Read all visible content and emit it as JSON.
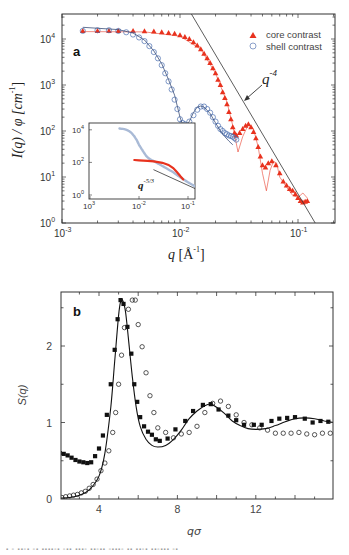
{
  "chart_data": [
    {
      "panel": "a",
      "type": "scatter",
      "scale": {
        "x": "log",
        "y": "log"
      },
      "xlim": [
        0.001,
        0.2
      ],
      "ylim": [
        1,
        35000
      ],
      "xlabel": "q [Å⁻¹]",
      "ylabel": "I(q) / φ [cm⁻¹]",
      "xticks": [
        "10⁻³",
        "10⁻²",
        "10⁻¹"
      ],
      "yticks": [
        "10⁰",
        "10¹",
        "10²",
        "10³",
        "10⁴"
      ],
      "legend": {
        "position": "upper right",
        "entries": [
          "core contrast",
          "shell contrast"
        ]
      },
      "annotations": [
        "a",
        "q⁻⁴"
      ],
      "series": [
        {
          "name": "core contrast",
          "marker": "filled-triangle",
          "color": "#e8321e",
          "x": [
            0.0015,
            0.002,
            0.0025,
            0.003,
            0.004,
            0.005,
            0.006,
            0.007,
            0.008,
            0.009,
            0.01,
            0.011,
            0.012,
            0.013,
            0.014,
            0.015,
            0.016,
            0.017,
            0.018,
            0.019,
            0.02,
            0.021,
            0.022,
            0.023,
            0.024,
            0.025,
            0.026,
            0.027,
            0.028,
            0.029,
            0.03,
            0.032,
            0.034,
            0.036,
            0.038,
            0.04,
            0.042,
            0.044,
            0.046,
            0.048,
            0.05,
            0.053,
            0.056,
            0.06,
            0.065,
            0.07,
            0.075,
            0.08,
            0.085,
            0.09,
            0.095,
            0.1,
            0.105,
            0.11,
            0.115,
            0.12
          ],
          "y": [
            15000,
            15000,
            15000,
            15000,
            15000,
            14800,
            14500,
            14000,
            13500,
            13000,
            12000,
            11000,
            10000,
            8500,
            7200,
            6000,
            4800,
            3800,
            3000,
            2300,
            1800,
            1300,
            1000,
            700,
            520,
            380,
            260,
            180,
            120,
            90,
            80,
            90,
            110,
            130,
            140,
            120,
            95,
            70,
            45,
            28,
            18,
            16,
            20,
            22,
            18,
            12,
            8,
            6.5,
            5.5,
            5,
            4.2,
            3.5,
            3,
            2.8,
            2.9,
            3
          ]
        },
        {
          "name": "core contrast fit",
          "type": "line",
          "color": "#e8321e",
          "x": [
            0.0015,
            0.005,
            0.01,
            0.015,
            0.02,
            0.025,
            0.028,
            0.031,
            0.034,
            0.038,
            0.042,
            0.046,
            0.05,
            0.054,
            0.058,
            0.062,
            0.066,
            0.07,
            0.08,
            0.09,
            0.1,
            0.11,
            0.12
          ],
          "y": [
            14500,
            14300,
            11500,
            6000,
            1800,
            420,
            130,
            35,
            75,
            140,
            110,
            45,
            12,
            5,
            14,
            22,
            20,
            10,
            6,
            4,
            3.6,
            4.5,
            3.5
          ]
        },
        {
          "name": "shell contrast",
          "marker": "open-circle",
          "color": "#4a6fb0",
          "x": [
            0.0015,
            0.002,
            0.0025,
            0.003,
            0.0035,
            0.004,
            0.0045,
            0.005,
            0.0055,
            0.006,
            0.0065,
            0.007,
            0.0075,
            0.008,
            0.0085,
            0.009,
            0.0095,
            0.01,
            0.0105,
            0.011,
            0.012,
            0.013,
            0.014,
            0.015,
            0.016,
            0.017,
            0.018,
            0.019,
            0.02,
            0.021,
            0.022,
            0.023,
            0.024,
            0.025,
            0.026,
            0.027,
            0.028,
            0.029,
            0.03
          ],
          "y": [
            15000,
            15500,
            15500,
            15000,
            14000,
            12500,
            10800,
            9000,
            7000,
            5200,
            3800,
            2700,
            1800,
            1200,
            800,
            480,
            300,
            180,
            150,
            140,
            160,
            220,
            290,
            340,
            340,
            300,
            250,
            200,
            160,
            130,
            110,
            100,
            90,
            85,
            80,
            78,
            75,
            70,
            65
          ]
        },
        {
          "name": "shell contrast fit",
          "type": "line",
          "color": "#3b4f7a",
          "x": [
            0.0015,
            0.003,
            0.004,
            0.005,
            0.006,
            0.007,
            0.008,
            0.009,
            0.01,
            0.0105,
            0.011,
            0.012,
            0.013,
            0.014,
            0.015,
            0.016,
            0.018,
            0.02,
            0.022,
            0.024,
            0.026,
            0.028
          ],
          "y": [
            18000,
            16000,
            13500,
            9500,
            5500,
            2900,
            1300,
            600,
            200,
            140,
            130,
            160,
            250,
            330,
            350,
            330,
            240,
            150,
            100,
            75,
            60,
            50
          ]
        },
        {
          "name": "q^-4 guide",
          "type": "line",
          "color": "#333333",
          "x": [
            0.0125,
            0.14
          ],
          "y": [
            35000,
            1
          ]
        }
      ],
      "inset": {
        "scale": {
          "x": "log",
          "y": "log"
        },
        "xlim": [
          0.001,
          0.2
        ],
        "ylim": [
          1,
          20000
        ],
        "xticks": [
          "10⁻³",
          "10⁻²",
          "10⁻¹"
        ],
        "yticks": [
          "10⁰",
          "10²",
          "10⁴"
        ],
        "annotation": "q⁻⁵ᐟ³",
        "series": [
          {
            "name": "shell (light)",
            "color": "#a9bad6",
            "x": [
              0.004,
              0.005,
              0.006,
              0.007,
              0.008,
              0.009,
              0.01,
              0.012,
              0.014,
              0.016,
              0.018,
              0.02,
              0.03,
              0.05,
              0.07,
              0.1,
              0.15
            ],
            "y": [
              12000,
              11000,
              9000,
              6500,
              4000,
              2300,
              1200,
              500,
              250,
              170,
              140,
              120,
              60,
              25,
              12,
              6,
              3
            ]
          },
          {
            "name": "core (red)",
            "color": "#e8321e",
            "x": [
              0.008,
              0.01,
              0.015,
              0.02,
              0.03,
              0.04,
              0.05,
              0.06,
              0.07,
              0.08
            ],
            "y": [
              140,
              135,
              125,
              115,
              95,
              70,
              45,
              25,
              14,
              9
            ]
          },
          {
            "name": "q^-5/3 guide",
            "type": "line",
            "color": "#333333",
            "x": [
              0.02,
              0.2
            ],
            "y": [
              35,
              1.5
            ]
          }
        ]
      }
    },
    {
      "panel": "b",
      "type": "scatter",
      "xlim": [
        2,
        16
      ],
      "ylim": [
        0,
        2.7
      ],
      "xlabel": "qσ",
      "ylabel": "S(q)",
      "xticks": [
        4,
        8,
        12
      ],
      "yticks": [
        0,
        1,
        2
      ],
      "annotations": [
        "b"
      ],
      "series": [
        {
          "name": "filled squares",
          "marker": "filled-square",
          "color": "#111111",
          "x": [
            2.0,
            2.2,
            2.4,
            2.6,
            2.8,
            3.0,
            3.2,
            3.4,
            3.6,
            3.8,
            4.0,
            4.2,
            4.4,
            4.6,
            4.8,
            4.95,
            5.1,
            5.25,
            5.45,
            5.65,
            5.8,
            5.95,
            6.1,
            6.3,
            6.5,
            6.7,
            6.9,
            7.1,
            7.5,
            7.9,
            8.4,
            8.8,
            9.3,
            9.7,
            10.1,
            10.6,
            11.0,
            11.4,
            11.9,
            12.3,
            12.8,
            13.2,
            13.6,
            14.0,
            14.5,
            14.9,
            15.3,
            15.7
          ],
          "y": [
            0.6,
            0.59,
            0.57,
            0.54,
            0.51,
            0.49,
            0.48,
            0.47,
            0.48,
            0.56,
            0.66,
            0.83,
            1.1,
            1.5,
            1.95,
            2.35,
            2.6,
            2.55,
            2.25,
            1.9,
            1.5,
            1.27,
            1.07,
            0.95,
            0.88,
            0.84,
            0.78,
            0.76,
            0.79,
            0.91,
            1.02,
            1.15,
            1.23,
            1.24,
            1.17,
            1.09,
            1.03,
            0.97,
            0.97,
            0.97,
            1.02,
            1.05,
            1.06,
            1.07,
            1.05,
            1.0,
            1.02,
            1.01
          ]
        },
        {
          "name": "open circles",
          "marker": "open-circle",
          "color": "#111111",
          "x": [
            2.1,
            2.3,
            2.5,
            2.7,
            2.9,
            3.1,
            3.3,
            3.5,
            3.7,
            3.9,
            4.1,
            4.3,
            4.5,
            4.7,
            4.85,
            5.0,
            5.15,
            5.3,
            5.5,
            5.7,
            5.85,
            6.0,
            6.2,
            6.4,
            6.6,
            6.8,
            7.0,
            7.4,
            7.8,
            8.2,
            8.6,
            9.0,
            9.4,
            9.8,
            10.2,
            10.6,
            11.0,
            11.4,
            11.8,
            12.2,
            12.6,
            13.0,
            13.4,
            13.8,
            14.2,
            14.6,
            15.0,
            15.4,
            15.8
          ],
          "y": [
            0.02,
            0.03,
            0.04,
            0.05,
            0.06,
            0.08,
            0.1,
            0.14,
            0.19,
            0.26,
            0.37,
            0.47,
            0.63,
            0.87,
            1.13,
            1.5,
            1.88,
            2.24,
            2.48,
            2.6,
            2.6,
            2.28,
            1.99,
            1.65,
            1.35,
            1.13,
            0.93,
            0.87,
            0.8,
            0.85,
            0.87,
            0.95,
            1.13,
            1.25,
            1.28,
            1.21,
            1.1,
            1.0,
            0.97,
            0.93,
            0.9,
            0.86,
            0.86,
            0.86,
            0.87,
            0.85,
            0.84,
            0.86,
            0.86
          ]
        },
        {
          "name": "theory",
          "type": "line",
          "color": "#111111",
          "x": [
            2.0,
            2.5,
            3.0,
            3.5,
            4.0,
            4.3,
            4.6,
            4.8,
            5.0,
            5.1,
            5.2,
            5.35,
            5.5,
            5.7,
            5.9,
            6.1,
            6.4,
            6.7,
            7.0,
            7.4,
            7.8,
            8.2,
            8.6,
            9.0,
            9.4,
            9.7,
            10.0,
            10.4,
            10.8,
            11.2,
            11.6,
            12.0,
            12.5,
            13.0,
            13.5,
            14.0,
            14.5,
            15.0,
            15.5,
            16.0
          ],
          "y": [
            0.01,
            0.02,
            0.05,
            0.12,
            0.3,
            0.6,
            1.2,
            1.8,
            2.4,
            2.58,
            2.6,
            2.45,
            2.1,
            1.6,
            1.2,
            0.95,
            0.78,
            0.7,
            0.68,
            0.7,
            0.78,
            0.9,
            1.05,
            1.15,
            1.22,
            1.24,
            1.2,
            1.12,
            1.02,
            0.96,
            0.92,
            0.91,
            0.92,
            0.96,
            1.01,
            1.05,
            1.06,
            1.05,
            1.02,
            1.0
          ]
        }
      ]
    }
  ],
  "panel_a": {
    "label": "a",
    "xlabel_q": "q",
    "xlabel_unit": "[Å",
    "xlabel_exp": "-1",
    "xlabel_close": "]",
    "ylabel": "I(q) / φ [cm",
    "ylabel_exp": "-1",
    "ylabel_close": "]",
    "slope_label": "q",
    "slope_exp": "-4",
    "legend": [
      {
        "label": "core contrast"
      },
      {
        "label": "shell contrast"
      }
    ],
    "xticks": [
      {
        "base": "10",
        "exp": "-3"
      },
      {
        "base": "10",
        "exp": "-2"
      },
      {
        "base": "10",
        "exp": "-1"
      }
    ],
    "yticks": [
      {
        "base": "10",
        "exp": "0"
      },
      {
        "base": "10",
        "exp": "1"
      },
      {
        "base": "10",
        "exp": "2"
      },
      {
        "base": "10",
        "exp": "3"
      },
      {
        "base": "10",
        "exp": "4"
      }
    ],
    "inset": {
      "slope_label": "q",
      "slope_exp": "-5/3",
      "xticks": [
        {
          "base": "10",
          "exp": "3"
        },
        {
          "base": "10",
          "exp": "-2"
        },
        {
          "base": "10",
          "exp": "-1"
        }
      ],
      "yticks": [
        {
          "base": "10",
          "exp": "0"
        },
        {
          "base": "10",
          "exp": "2"
        },
        {
          "base": "10",
          "exp": "4"
        }
      ]
    }
  },
  "panel_b": {
    "label": "b",
    "xlabel": "qσ",
    "ylabel": "S(q)",
    "xticks": [
      "4",
      "8",
      "12"
    ],
    "yticks": [
      "0",
      "1",
      "2"
    ]
  },
  "colors": {
    "core": "#e8321e",
    "shell": "#4a6fb0",
    "shell_fit": "#3b4f7a",
    "axis": "#333333",
    "inset_shell": "#a9bad6"
  }
}
